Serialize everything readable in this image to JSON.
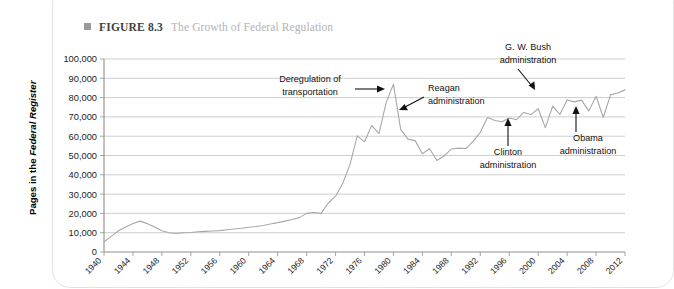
{
  "figure": {
    "marker": "square-bullet",
    "label": "FIGURE 8.3",
    "title": "The Growth of Federal Regulation"
  },
  "chart_data": {
    "type": "line",
    "title": "The Growth of Federal Regulation",
    "xlabel": "",
    "ylabel": "Pages in the Federal Register",
    "ylabel_parts": {
      "prefix": "Pages in the ",
      "italic": "Federal Register"
    },
    "xlim": [
      1940,
      2012
    ],
    "ylim": [
      0,
      100000
    ],
    "grid": true,
    "legend": "none",
    "ytick_labels": [
      "0",
      "10,000",
      "20,000",
      "30,000",
      "40,000",
      "50,000",
      "60,000",
      "70,000",
      "80,000",
      "90,000",
      "100,000"
    ],
    "ytick_values": [
      0,
      10000,
      20000,
      30000,
      40000,
      50000,
      60000,
      70000,
      80000,
      90000,
      100000
    ],
    "xtick_labels": [
      "1940",
      "1944",
      "1948",
      "1952",
      "1956",
      "1960",
      "1964",
      "1968",
      "1972",
      "1976",
      "1980",
      "1984",
      "1988",
      "1992",
      "1996",
      "2000",
      "2004",
      "2008",
      "2012"
    ],
    "xtick_values": [
      1940,
      1944,
      1948,
      1952,
      1956,
      1960,
      1964,
      1968,
      1972,
      1976,
      1980,
      1984,
      1988,
      1992,
      1996,
      2000,
      2004,
      2008,
      2012
    ],
    "series": [
      {
        "name": "Pages in the Federal Register",
        "color": "#a8a8a8",
        "x": [
          1940,
          1941,
          1942,
          1943,
          1944,
          1945,
          1946,
          1947,
          1948,
          1949,
          1950,
          1951,
          1952,
          1953,
          1954,
          1955,
          1956,
          1957,
          1958,
          1959,
          1960,
          1961,
          1962,
          1963,
          1964,
          1965,
          1966,
          1967,
          1968,
          1969,
          1970,
          1971,
          1972,
          1973,
          1974,
          1975,
          1976,
          1977,
          1978,
          1979,
          1980,
          1981,
          1982,
          1983,
          1984,
          1985,
          1986,
          1987,
          1988,
          1989,
          1990,
          1991,
          1992,
          1993,
          1994,
          1995,
          1996,
          1997,
          1998,
          1999,
          2000,
          2001,
          2002,
          2003,
          2004,
          2005,
          2006,
          2007,
          2008,
          2009,
          2010,
          2011,
          2012
        ],
        "y": [
          5300,
          8100,
          11000,
          13000,
          14800,
          16000,
          14700,
          13000,
          11000,
          10000,
          9600,
          10000,
          10100,
          10500,
          10700,
          10900,
          11100,
          11500,
          11900,
          12300,
          12800,
          13200,
          13700,
          14500,
          15200,
          16000,
          16800,
          17800,
          20000,
          20500,
          20000,
          25400,
          28900,
          35600,
          45400,
          60200,
          57100,
          65600,
          61300,
          77500,
          87000,
          63500,
          58500,
          57700,
          50900,
          53500,
          47400,
          49700,
          53400,
          53800,
          53600,
          57300,
          62000,
          69700,
          68100,
          67500,
          69400,
          68500,
          72300,
          71200,
          74200,
          64400,
          75600,
          71300,
          78800,
          77800,
          78700,
          73000,
          80700,
          69700,
          81400,
          82400,
          84000
        ]
      }
    ],
    "annotations": [
      {
        "id": "deregulation",
        "lines": [
          "Deregulation of",
          "transportation"
        ],
        "pointer": "arrow-right",
        "target_year": 1980,
        "target_value": 87000
      },
      {
        "id": "reagan",
        "lines": [
          "Reagan",
          "administration"
        ],
        "pointer": "arrow-down-left",
        "target_year": 1982,
        "target_value": 63500
      },
      {
        "id": "gw-bush",
        "lines": [
          "G. W. Bush",
          "administration"
        ],
        "pointer": "arrow-down-right",
        "target_year": 2001,
        "target_value": 64400
      },
      {
        "id": "clinton",
        "lines": [
          "Clinton",
          "administration"
        ],
        "pointer": "arrow-up",
        "target_year": 1996,
        "target_value": 69400
      },
      {
        "id": "obama",
        "lines": [
          "Obama",
          "administration"
        ],
        "pointer": "arrow-up",
        "target_year": 2009,
        "target_value": 69700
      }
    ]
  }
}
